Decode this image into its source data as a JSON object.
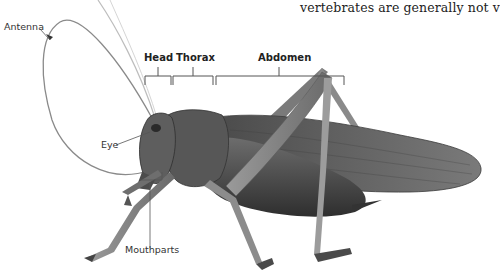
{
  "caption": {
    "text": "vertebrates are generally not v"
  },
  "figure": {
    "segments": [
      {
        "label": "Head"
      },
      {
        "label": "Thorax"
      },
      {
        "label": "Abdomen"
      }
    ],
    "callouts": {
      "antenna": "Antenna",
      "eye": "Eye",
      "mouthparts": "Mouthparts"
    },
    "colors": {
      "label_line": "#555555",
      "body_dark": "#3c3c3c",
      "body_mid": "#6a6a6a",
      "wing": "#5a5a5a"
    }
  }
}
